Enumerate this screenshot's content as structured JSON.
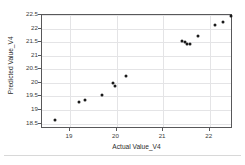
{
  "chart_data": {
    "type": "scatter",
    "title": "",
    "xlabel": "Actual Value_V4",
    "ylabel": "Predicted Value_V4",
    "xlim": [
      18.4,
      22.5
    ],
    "ylim": [
      18.3,
      22.5
    ],
    "xticks": [
      "19",
      "20",
      "21",
      "22"
    ],
    "xtick_values": [
      19,
      20,
      21,
      22
    ],
    "yticks": [
      "18.5",
      "19",
      "19.5",
      "20",
      "20.5",
      "21",
      "21.5",
      "22",
      "22.5"
    ],
    "ytick_values": [
      18.5,
      19,
      19.5,
      20,
      20.5,
      21,
      21.5,
      22,
      22.5
    ],
    "grid": true,
    "legend": false,
    "marker": "filled-circle",
    "marker_color": "#1a1a1a",
    "series": [
      {
        "name": "Predicted vs Actual",
        "points": [
          {
            "x": 18.68,
            "y": 18.63
          },
          {
            "x": 19.2,
            "y": 19.31
          },
          {
            "x": 19.32,
            "y": 19.38
          },
          {
            "x": 19.69,
            "y": 19.57
          },
          {
            "x": 19.93,
            "y": 19.98
          },
          {
            "x": 19.96,
            "y": 19.88
          },
          {
            "x": 20.2,
            "y": 20.27
          },
          {
            "x": 21.41,
            "y": 21.53
          },
          {
            "x": 21.47,
            "y": 21.5
          },
          {
            "x": 21.52,
            "y": 21.45
          },
          {
            "x": 21.58,
            "y": 21.44
          },
          {
            "x": 21.74,
            "y": 21.71
          },
          {
            "x": 22.12,
            "y": 22.12
          },
          {
            "x": 22.28,
            "y": 22.25
          },
          {
            "x": 22.45,
            "y": 22.48
          }
        ]
      }
    ]
  }
}
